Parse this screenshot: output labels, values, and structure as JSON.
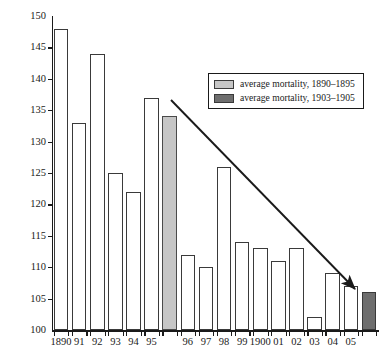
{
  "chart_data": {
    "type": "bar",
    "title": "",
    "xlabel": "",
    "ylabel": "IMR",
    "ylim": [
      100,
      150
    ],
    "ytick_step": 5,
    "yticks": [
      100,
      105,
      110,
      115,
      120,
      125,
      130,
      135,
      140,
      145,
      150
    ],
    "grid": false,
    "legend_position": "upper-right",
    "categories": [
      "1890",
      "91",
      "92",
      "93",
      "94",
      "95",
      "",
      "96",
      "97",
      "98",
      "99",
      "1900",
      "01",
      "02",
      "03",
      "04",
      "05",
      ""
    ],
    "values": [
      148,
      133,
      144,
      125,
      122,
      137,
      134,
      112,
      110,
      126,
      114,
      113,
      111,
      113,
      102,
      109,
      107,
      106
    ],
    "bar_kinds": [
      "plain",
      "plain",
      "plain",
      "plain",
      "plain",
      "plain",
      "light-gray",
      "plain",
      "plain",
      "plain",
      "plain",
      "plain",
      "plain",
      "plain",
      "plain",
      "plain",
      "plain",
      "dark-gray"
    ],
    "series": [
      {
        "name": "annual IMR",
        "points": [
          {
            "x": "1890",
            "y": 148
          },
          {
            "x": "91",
            "y": 133
          },
          {
            "x": "92",
            "y": 144
          },
          {
            "x": "93",
            "y": 125
          },
          {
            "x": "94",
            "y": 122
          },
          {
            "x": "95",
            "y": 137
          },
          {
            "x": "96",
            "y": 112
          },
          {
            "x": "97",
            "y": 110
          },
          {
            "x": "98",
            "y": 126
          },
          {
            "x": "99",
            "y": 114
          },
          {
            "x": "1900",
            "y": 113
          },
          {
            "x": "01",
            "y": 111
          },
          {
            "x": "02",
            "y": 113
          },
          {
            "x": "03",
            "y": 102
          },
          {
            "x": "04",
            "y": 109
          },
          {
            "x": "05",
            "y": 107
          }
        ]
      },
      {
        "name": "average mortality, 1890-1895",
        "points": [
          {
            "x": "avg 1890-1895",
            "y": 134
          }
        ]
      },
      {
        "name": "average mortality, 1903-1905",
        "points": [
          {
            "x": "avg 1903-1905",
            "y": 106
          }
        ]
      }
    ],
    "annotations": [
      {
        "type": "arrow",
        "label": "declining trend arrow",
        "from_value": 136,
        "to_value": 106
      }
    ]
  },
  "axes": {
    "y_title": "IMR",
    "y_tick_labels": [
      "150",
      "145",
      "140",
      "135",
      "130",
      "125",
      "120",
      "115",
      "110",
      "105",
      "100"
    ],
    "x_tick_labels": [
      "1890",
      "91",
      "92",
      "93",
      "94",
      "95",
      "96",
      "97",
      "98",
      "99",
      "1900",
      "01",
      "02",
      "03",
      "04",
      "05"
    ]
  },
  "legend": {
    "entries": [
      {
        "label": "average mortality, 1890–1895",
        "color": "#c6c6c6",
        "swatch": "light-gray-swatch"
      },
      {
        "label": "average mortality, 1903–1905",
        "color": "#6e6e6e",
        "swatch": "dark-gray-swatch"
      }
    ]
  },
  "colors": {
    "plain_bar_fill": "#ffffff",
    "plain_bar_stroke": "#3a3a3a",
    "light_gray_bar": "#c6c6c6",
    "dark_gray_bar": "#6e6e6e",
    "axis": "#1a1a1a",
    "background": "#ffffff"
  }
}
